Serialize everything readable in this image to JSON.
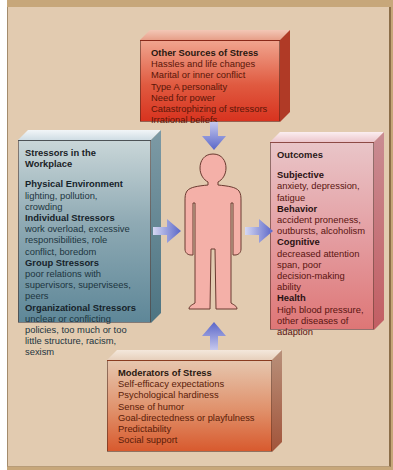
{
  "diagram": {
    "center": {
      "label": "person",
      "icon": "human-figure-icon"
    },
    "other_sources": {
      "title": "Other Sources of Stress",
      "items": [
        "Hassles and life changes",
        "Marital or inner conflict",
        "Type A personality",
        "Need for power",
        "Catastrophizing of stressors",
        "Irrational beliefs"
      ]
    },
    "workplace": {
      "title": "Stressors in the Workplace",
      "groups": [
        {
          "heading": "Physical Environment",
          "lines": [
            "lighting, pollution,",
            "crowding"
          ]
        },
        {
          "heading": "Individual Stressors",
          "lines": [
            "work overload, excessive",
            "responsibilities, role",
            "conflict, boredom"
          ]
        },
        {
          "heading": "Group Stressors",
          "lines": [
            "poor relations with",
            "supervisors, supervisees,",
            "peers"
          ]
        },
        {
          "heading": "Organizational Stressors",
          "lines": [
            "unclear or conflicting",
            "policies, too much or too",
            "little structure, racism,",
            "sexism"
          ]
        }
      ]
    },
    "outcomes": {
      "title": "Outcomes",
      "groups": [
        {
          "heading": "Subjective",
          "lines": [
            "anxiety, depression,",
            "fatigue"
          ]
        },
        {
          "heading": "Behavior",
          "lines": [
            "accident proneness,",
            "outbursts, alcoholism"
          ]
        },
        {
          "heading": "Cognitive",
          "lines": [
            "decreased attention",
            "span, poor",
            "decision-making ability"
          ]
        },
        {
          "heading": "Health",
          "lines": [
            "High blood pressure,",
            "other diseases of",
            "adaption"
          ]
        }
      ]
    },
    "moderators": {
      "title": "Moderators of Stress",
      "items": [
        "Self-efficacy expectations",
        "Psychological hardiness",
        "Sense of humor",
        "Goal-directedness or playfulness",
        "Predictability",
        "Social support"
      ]
    },
    "colors": {
      "background": "#e2cbb0",
      "frame": "#c7a77a",
      "other_sources_box": "#e05a40",
      "workplace_box": "#8faab4",
      "outcomes_box": "#e49ea2",
      "moderators_box": "#e0906a",
      "person_fill": "#f4b0a8",
      "arrow": "#6a74d0"
    }
  }
}
